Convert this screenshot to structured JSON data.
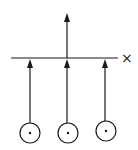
{
  "diagram": {
    "stroke_color": "#1a1a1a",
    "baseline": {
      "x1": 11,
      "x2": 118,
      "y": 58
    },
    "cross_marker": {
      "symbol": "×",
      "x": 121,
      "y": 50
    },
    "output_arrow": {
      "x": 67,
      "y_from": 58,
      "y_to": 14
    },
    "inputs": [
      {
        "id": "input-1",
        "circle_cx": 30,
        "circle_cy": 133,
        "r": 10,
        "arrow_x": 30
      },
      {
        "id": "input-2",
        "circle_cx": 68,
        "circle_cy": 133,
        "r": 10,
        "arrow_x": 67
      },
      {
        "id": "input-3",
        "circle_cx": 106,
        "circle_cy": 131,
        "r": 10,
        "arrow_x": 105
      }
    ]
  }
}
